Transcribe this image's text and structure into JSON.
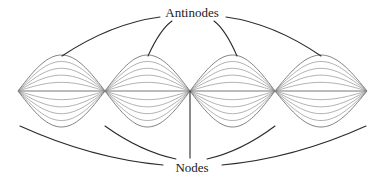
{
  "figure": {
    "type": "standing-wave-diagram",
    "title": "",
    "background_color": "#ffffff"
  },
  "labels": {
    "antinodes": "Antinodes",
    "nodes": "Nodes"
  },
  "label_positions": {
    "antinodes": {
      "x": 192,
      "y": 14
    },
    "nodes": {
      "x": 192,
      "y": 169
    }
  },
  "colors": {
    "envelope": "#7a7a7a",
    "inner_curve": "#8c8c8c",
    "axis": "#707070",
    "leader": "#2b2b2b",
    "text": "#1a1a1a"
  },
  "geometry": {
    "axis_y": 91,
    "node_x": [
      18,
      105,
      190,
      275,
      367
    ],
    "lobe_amplitude_max": 36,
    "curve_count_per_lobe": 11,
    "amplitude_fractions": [
      1.0,
      0.82,
      0.63,
      0.44,
      0.24,
      0.0,
      -0.24,
      -0.44,
      -0.63,
      -0.82,
      -1.0
    ]
  },
  "chart_data": {
    "type": "line",
    "xlabel": "",
    "ylabel": "",
    "nodes_x": [
      18,
      105,
      190,
      275,
      367
    ],
    "antinodes_x": [
      61.5,
      147.5,
      232.5,
      321
    ],
    "loops": 4,
    "series_count": 11,
    "amplitude_fractions": [
      1.0,
      0.82,
      0.63,
      0.44,
      0.24,
      0.0,
      -0.24,
      -0.44,
      -0.63,
      -0.82,
      -1.0
    ]
  },
  "leaders": {
    "antinode_leaders": [
      {
        "name": "antinode-leader-1",
        "from_x": 160,
        "from_y": 17,
        "to_x": 62,
        "to_y": 56
      },
      {
        "name": "antinode-leader-2",
        "from_x": 172,
        "from_y": 21,
        "to_x": 148,
        "to_y": 56
      },
      {
        "name": "antinode-leader-3",
        "from_x": 214,
        "from_y": 21,
        "to_x": 237,
        "to_y": 56
      },
      {
        "name": "antinode-leader-4",
        "from_x": 226,
        "from_y": 17,
        "to_x": 321,
        "to_y": 56
      }
    ],
    "node_leaders": [
      {
        "name": "node-leader-left-outer",
        "from_x": 163,
        "from_y": 165,
        "to_x": 20,
        "to_y": 126
      },
      {
        "name": "node-leader-left-inner",
        "from_x": 176,
        "from_y": 159,
        "to_x": 105,
        "to_y": 126
      },
      {
        "name": "node-leader-center",
        "from_x": 190,
        "from_y": 158,
        "to_x": 190,
        "to_y": 91
      },
      {
        "name": "node-leader-right-inner",
        "from_x": 207,
        "from_y": 159,
        "to_x": 275,
        "to_y": 126
      },
      {
        "name": "node-leader-right-outer",
        "from_x": 222,
        "from_y": 165,
        "to_x": 366,
        "to_y": 126
      }
    ]
  }
}
